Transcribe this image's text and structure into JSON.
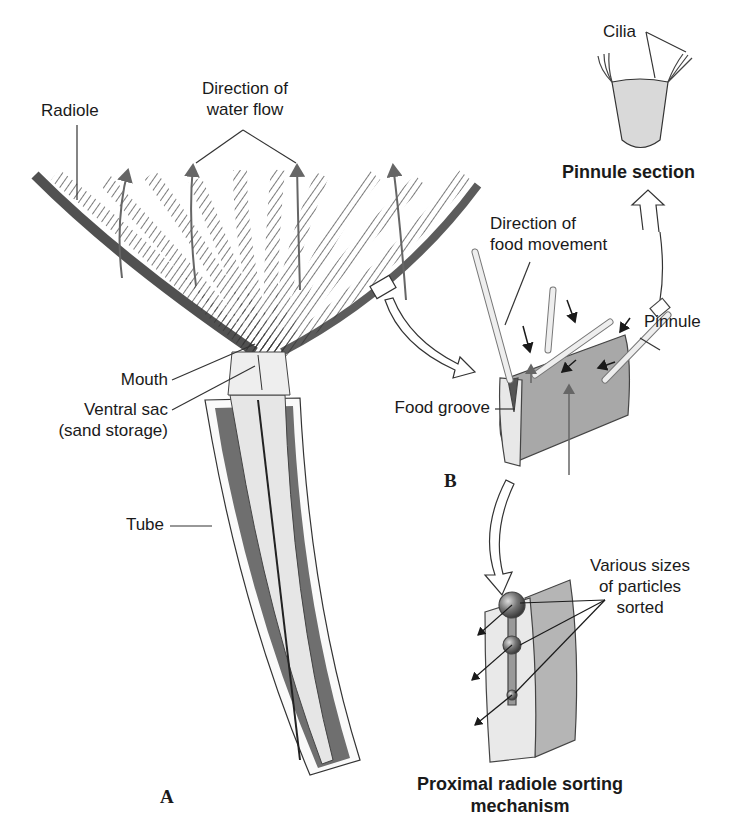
{
  "figure": {
    "panels": {
      "a": "A",
      "b": "B"
    },
    "labels": {
      "radiole": "Radiole",
      "water_flow_1": "Direction of",
      "water_flow_2": "water flow",
      "mouth": "Mouth",
      "ventral_sac_1": "Ventral sac",
      "ventral_sac_2": "(sand storage)",
      "tube": "Tube",
      "cilia": "Cilia",
      "pinnule_section": "Pinnule section",
      "food_movement_1": "Direction of",
      "food_movement_2": "food movement",
      "pinnule": "Pinnule",
      "food_groove": "Food groove",
      "particles_1": "Various sizes",
      "particles_2": "of particles",
      "particles_3": "sorted",
      "sorting_1": "Proximal radiole sorting",
      "sorting_2": "mechanism"
    },
    "colors": {
      "ink": "#1a1a1a",
      "tube_dark": "#6f6f6f",
      "body_light": "#e6e6e6",
      "groove_gray": "#9a9a9a"
    }
  }
}
